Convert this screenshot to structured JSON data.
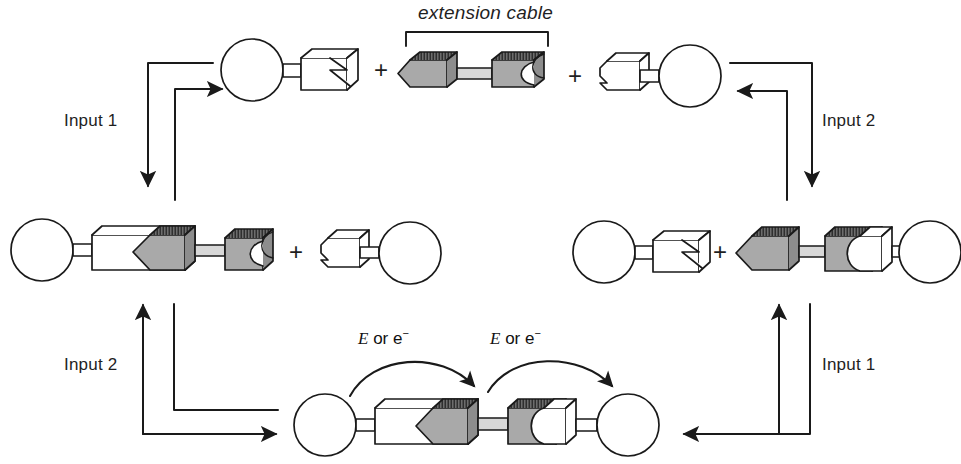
{
  "figure": {
    "type": "schematic-diagram",
    "title_text": "extension cable",
    "background": "#ffffff",
    "line_color": "#1a1a1a",
    "gray_fill": "#a9a9a9",
    "dark_edge": "#4a4a4a",
    "white_fill": "#ffffff"
  },
  "labels": {
    "extension_cable": "extension cable",
    "input1_top_left": "Input 1",
    "input2_top_right": "Input 2",
    "input2_bottom_left": "Input 2",
    "input1_bottom_right": "Input 1",
    "energy_left": {
      "italic": "E",
      "rest": "or e",
      "sup": "−"
    },
    "energy_right": {
      "italic": "E",
      "rest": "or e",
      "sup": "−"
    },
    "plus_top_1": "+",
    "plus_top_2": "+",
    "plus_mid_left": "+",
    "plus_mid_right": "+"
  },
  "rows": {
    "top": {
      "name": "reactants-row",
      "components": [
        {
          "name": "protein-with-socket-connector",
          "fill": "white",
          "sphere": "left",
          "connector": "v-notch-socket"
        },
        {
          "name": "extension-cable",
          "fill": "gray",
          "left_end": "arrow-plug",
          "right_end": "round-socket"
        },
        {
          "name": "protein-with-plug-connector",
          "fill": "white",
          "sphere": "right",
          "connector": "round-plug"
        }
      ]
    },
    "middle_left": {
      "name": "input1-product-row",
      "components": [
        {
          "name": "protein-cable-complex",
          "sphere": "left",
          "connector": "gray-plug-in-white-socket"
        },
        {
          "name": "free-protein-with-plug",
          "sphere": "right",
          "connector": "round-plug"
        }
      ]
    },
    "middle_right": {
      "name": "input2-product-row",
      "components": [
        {
          "name": "free-protein-with-socket",
          "sphere": "left",
          "connector": "v-notch-socket"
        },
        {
          "name": "cable-protein-complex",
          "sphere": "right",
          "connector": "gray-socket-with-white-plug"
        }
      ]
    },
    "bottom": {
      "name": "assembled-complex-row",
      "components": [
        {
          "name": "full-assembled-complex",
          "sphere_left": true,
          "sphere_right": true,
          "connector": "cable-bridged-junction"
        }
      ]
    }
  },
  "arrows": {
    "top_left_pair": {
      "name": "input1-arrows",
      "down_arrow": "to-middle-left",
      "up_arrow": "to-top-row"
    },
    "top_right_pair": {
      "name": "input2-arrows",
      "down_arrow": "to-middle-right",
      "left_arrow": "to-top-row"
    },
    "bottom_left_pair": {
      "name": "input2-arrows-bottom",
      "up_arrow": "to-middle-left",
      "right_arrow": "to-bottom-row"
    },
    "bottom_right_pair": {
      "name": "input1-arrows-bottom",
      "up_arrow": "to-middle-right",
      "left_arrow": "to-bottom-row"
    },
    "curved": [
      {
        "name": "energy-transfer-arrow-left",
        "direction": "left-to-center"
      },
      {
        "name": "energy-transfer-arrow-right",
        "direction": "center-to-right"
      }
    ]
  }
}
